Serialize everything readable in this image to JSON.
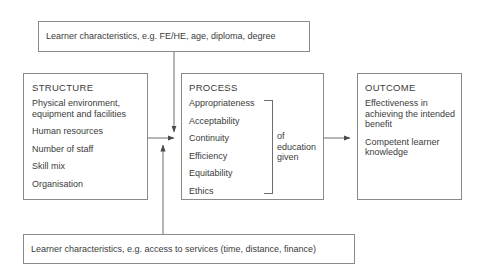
{
  "diagram": {
    "top_banner": {
      "text": "Learner characteristics, e.g. FE/HE, age, diploma, degree"
    },
    "bottom_banner": {
      "text": "Learner characteristics, e.g. access to services (time, distance, finance)"
    },
    "structure": {
      "title": "STRUCTURE",
      "items": [
        "Physical environment,\nequipment and facilities",
        "Human resources",
        "Number of staff",
        "Skill mix",
        "Organisation"
      ]
    },
    "process": {
      "title": "PROCESS",
      "items": [
        "Appropriateness",
        "Acceptability",
        "Continuity",
        "Efficiency",
        "Equitability",
        "Ethics"
      ],
      "bracket_label": "of\neducation\ngiven"
    },
    "outcome": {
      "title": "OUTCOME",
      "items": [
        "Effectiveness in\nachieving the intended\nbenefit",
        "Competent learner\n knowledge"
      ]
    },
    "colors": {
      "line": "#8a8a8a",
      "text": "#3b3b3b",
      "background": "#ffffff"
    }
  }
}
